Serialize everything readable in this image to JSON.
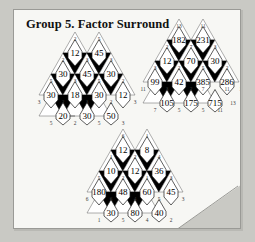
{
  "page": {
    "title": "Group 5. Factor Surround",
    "background_color": "#c9c9c4",
    "sheet_color": "#f7f7f4"
  },
  "puzzles": [
    {
      "id": "puzzle-left",
      "name": "factor-surround-left",
      "rows": [
        {
          "cells": [
            "12",
            "45"
          ]
        },
        {
          "cells": [
            "30",
            "45",
            "30"
          ]
        },
        {
          "cells": [
            "30",
            "18",
            "30",
            "12"
          ]
        },
        {
          "cells": [
            "20",
            "30",
            "50"
          ]
        }
      ],
      "factors": {
        "top": [
          "2",
          "5"
        ],
        "row2": [
          "2",
          "3",
          "3"
        ],
        "row3": [
          "5",
          "3",
          "5",
          "2"
        ],
        "row4": [
          "3",
          "2",
          "3",
          "2",
          "3"
        ],
        "bottom": [
          "5",
          "2",
          "5",
          "3"
        ]
      }
    },
    {
      "id": "puzzle-right",
      "name": "factor-surround-right",
      "rows": [
        {
          "cells": [
            "182",
            "231"
          ]
        },
        {
          "cells": [
            "12",
            "70",
            "30"
          ]
        },
        {
          "cells": [
            "99",
            "42",
            "385",
            "286"
          ]
        },
        {
          "cells": [
            "105",
            "175",
            "715"
          ]
        }
      ],
      "factors": {
        "top": [
          "13",
          "11"
        ],
        "row2": [
          "2",
          "7",
          "3"
        ],
        "row3": [
          "3",
          "2",
          "5",
          "2"
        ],
        "row4": [
          "11",
          "3",
          "2",
          "7",
          "11",
          "13"
        ],
        "bottom": [
          "7",
          "5",
          "5",
          "11",
          "13"
        ]
      }
    },
    {
      "id": "puzzle-bottom",
      "name": "factor-surround-bottom",
      "rows": [
        {
          "cells": [
            "12",
            "8"
          ]
        },
        {
          "cells": [
            "10",
            "12",
            "36"
          ]
        },
        {
          "cells": [
            "180",
            "48",
            "60",
            "45"
          ]
        },
        {
          "cells": [
            "30",
            "80",
            "40"
          ]
        }
      ],
      "factors": {
        "top": [
          "6",
          "1"
        ],
        "row2": [
          "1",
          "2",
          "4"
        ],
        "row3": [
          "5",
          "2",
          "1",
          "3"
        ],
        "row4": [
          "6",
          "6",
          "4",
          "5",
          "3"
        ],
        "bottom": [
          "1",
          "5",
          "4",
          "2"
        ]
      }
    }
  ]
}
